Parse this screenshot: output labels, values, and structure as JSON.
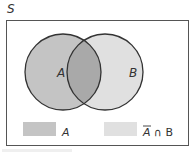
{
  "diagram": {
    "universe_label": "S",
    "sets": [
      {
        "label": "A",
        "cx": 63,
        "cy": 72,
        "r": 38
      },
      {
        "label": "B",
        "cx": 105,
        "cy": 72,
        "r": 38
      }
    ],
    "legend": [
      {
        "label": "A",
        "color": "#c4c4c4"
      },
      {
        "label": "Ā ∩ B",
        "label_bar": "A",
        "label_rest": " ∩ B",
        "color": "#e0e0e0"
      }
    ],
    "colors": {
      "a_only": "#c4c4c4",
      "intersection": "#a9a9a9",
      "b_only": "#e0e0e0",
      "stroke": "#333333",
      "border": "#555555"
    }
  }
}
